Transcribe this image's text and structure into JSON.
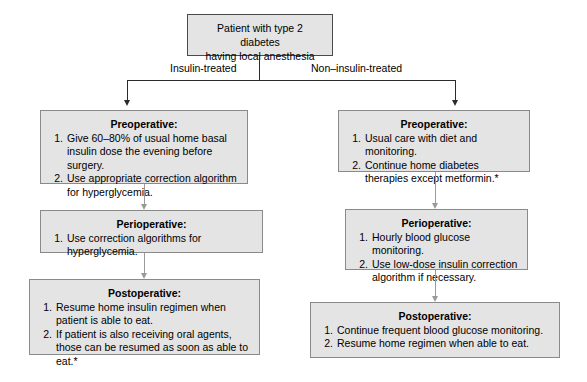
{
  "diagram": {
    "root": {
      "line1": "Patient with type 2 diabetes",
      "line2": "having local anesthesia"
    },
    "branches": [
      {
        "label": "Insulin-treated"
      },
      {
        "label": "Non–insulin-treated"
      }
    ],
    "left_column": [
      {
        "title": "Preoperative:",
        "steps": [
          {
            "num": "1.",
            "text": "Give 60–80% of usual home basal insulin dose the evening before surgery."
          },
          {
            "num": "2.",
            "text": "Use appropriate correction algorithm for hyperglycemia."
          }
        ]
      },
      {
        "title": "Perioperative:",
        "steps": [
          {
            "num": "1.",
            "text": "Use correction algorithms for hyperglycemia."
          }
        ]
      },
      {
        "title": "Postoperative:",
        "steps": [
          {
            "num": "1.",
            "text": "Resume home insulin regimen when patient is able to eat."
          },
          {
            "num": "2.",
            "text": "If patient is also receiving oral agents, those can be resumed as soon as able to eat.*"
          }
        ]
      }
    ],
    "right_column": [
      {
        "title": "Preoperative:",
        "steps": [
          {
            "num": "1.",
            "text": "Usual care with diet and monitoring."
          },
          {
            "num": "2.",
            "text": "Continue home diabetes therapies except metformin.*"
          }
        ]
      },
      {
        "title": "Perioperative:",
        "steps": [
          {
            "num": "1.",
            "text": "Hourly blood glucose monitoring."
          },
          {
            "num": "2.",
            "text": "Use low-dose insulin correction algorithm if necessary."
          }
        ]
      },
      {
        "title": "Postoperative:",
        "steps": [
          {
            "num": "1.",
            "text": "Continue frequent blood glucose monitoring."
          },
          {
            "num": "2.",
            "text": "Resume home regimen when able to eat."
          }
        ]
      }
    ],
    "colors": {
      "box_fill": "#e4e4e4",
      "box_border": "#8a8a8a",
      "root_border": "#4a4a4a",
      "connector": "#9a9a9a",
      "branch_line": "#2b2b2b",
      "text": "#000000",
      "background": "#ffffff"
    }
  }
}
